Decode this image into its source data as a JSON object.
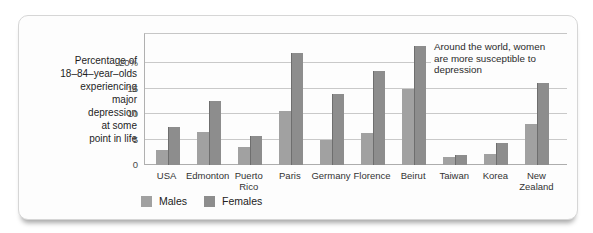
{
  "colors": {
    "male_bar": "#a1a1a1",
    "female_bar": "#8d8d8d",
    "gridline": "#c9c9c9",
    "axis": "#b0b0b0",
    "panel_border": "#d6d6d6"
  },
  "chart_data": {
    "type": "bar",
    "title_lines": [
      "Percentage of",
      "18–84–year–olds",
      "experiencing",
      "major",
      "depression",
      "at some",
      "point in life"
    ],
    "categories": [
      "USA",
      "Edmonton",
      "Puerto Rico",
      "Paris",
      "Germany",
      "Florence",
      "Beirut",
      "Taiwan",
      "Korea",
      "New Zealand"
    ],
    "category_display": [
      "USA",
      "Edmonton",
      "Puerto\nRico",
      "Paris",
      "Germany",
      "Florence",
      "Beirut",
      "Taiwan",
      "Korea",
      "New\nZealand"
    ],
    "series": [
      {
        "name": "Males",
        "color": "#a1a1a1",
        "values": [
          3.0,
          6.5,
          3.5,
          10.7,
          5.0,
          6.3,
          15.0,
          1.5,
          2.2,
          8.0
        ]
      },
      {
        "name": "Females",
        "color": "#8d8d8d",
        "values": [
          7.5,
          12.5,
          5.7,
          22.0,
          14.0,
          18.5,
          23.5,
          2.0,
          4.3,
          16.2
        ]
      }
    ],
    "y_ticks": [
      {
        "label": "20%",
        "value": 20
      },
      {
        "label": "15",
        "value": 15
      },
      {
        "label": "10",
        "value": 10
      },
      {
        "label": "5",
        "value": 5
      },
      {
        "label": "0",
        "value": 0
      }
    ],
    "ylim": [
      0,
      26
    ],
    "grid": true,
    "legend_position": "bottom",
    "annotation_lines": [
      "Around the world, women",
      "are more susceptible to",
      "depression"
    ]
  }
}
